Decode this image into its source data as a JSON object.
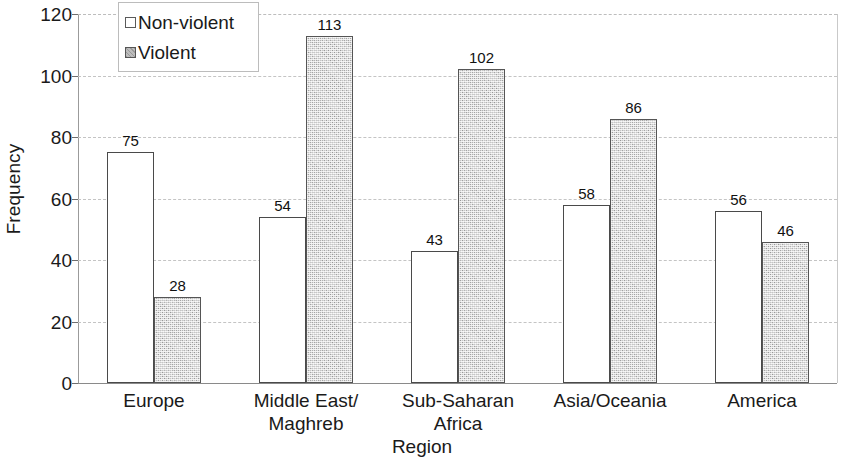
{
  "chart_data": {
    "type": "bar",
    "title": "",
    "xlabel": "Region",
    "ylabel": "Frequency",
    "categories": [
      "Europe",
      "Middle East/\nMaghreb",
      "Sub-Saharan\nAfrica",
      "Asia/Oceania",
      "America"
    ],
    "series": [
      {
        "name": "Non-violent",
        "values": [
          75,
          54,
          43,
          58,
          56
        ],
        "color": "#ffffff",
        "edge_color": "#4a4a4a"
      },
      {
        "name": "Violent",
        "values": [
          28,
          113,
          102,
          86,
          46
        ],
        "color": "#c6c6c6",
        "edge_color": "#555555"
      }
    ],
    "ylim": [
      0,
      120
    ],
    "yticks": [
      0,
      20,
      40,
      60,
      80,
      100,
      120
    ],
    "ytick_labels": [
      "0",
      "20",
      "40",
      "60",
      "80",
      "100",
      "120"
    ],
    "grid": "horizontal-dashed",
    "legend_position": "upper-left-inside",
    "data_labels": true
  },
  "axes": {
    "y_title": "Frequency",
    "x_title": "Region"
  },
  "legend": {
    "entries": [
      {
        "label": "Non-violent",
        "swatch": "nonviolent"
      },
      {
        "label": "Violent",
        "swatch": "violent"
      }
    ]
  }
}
